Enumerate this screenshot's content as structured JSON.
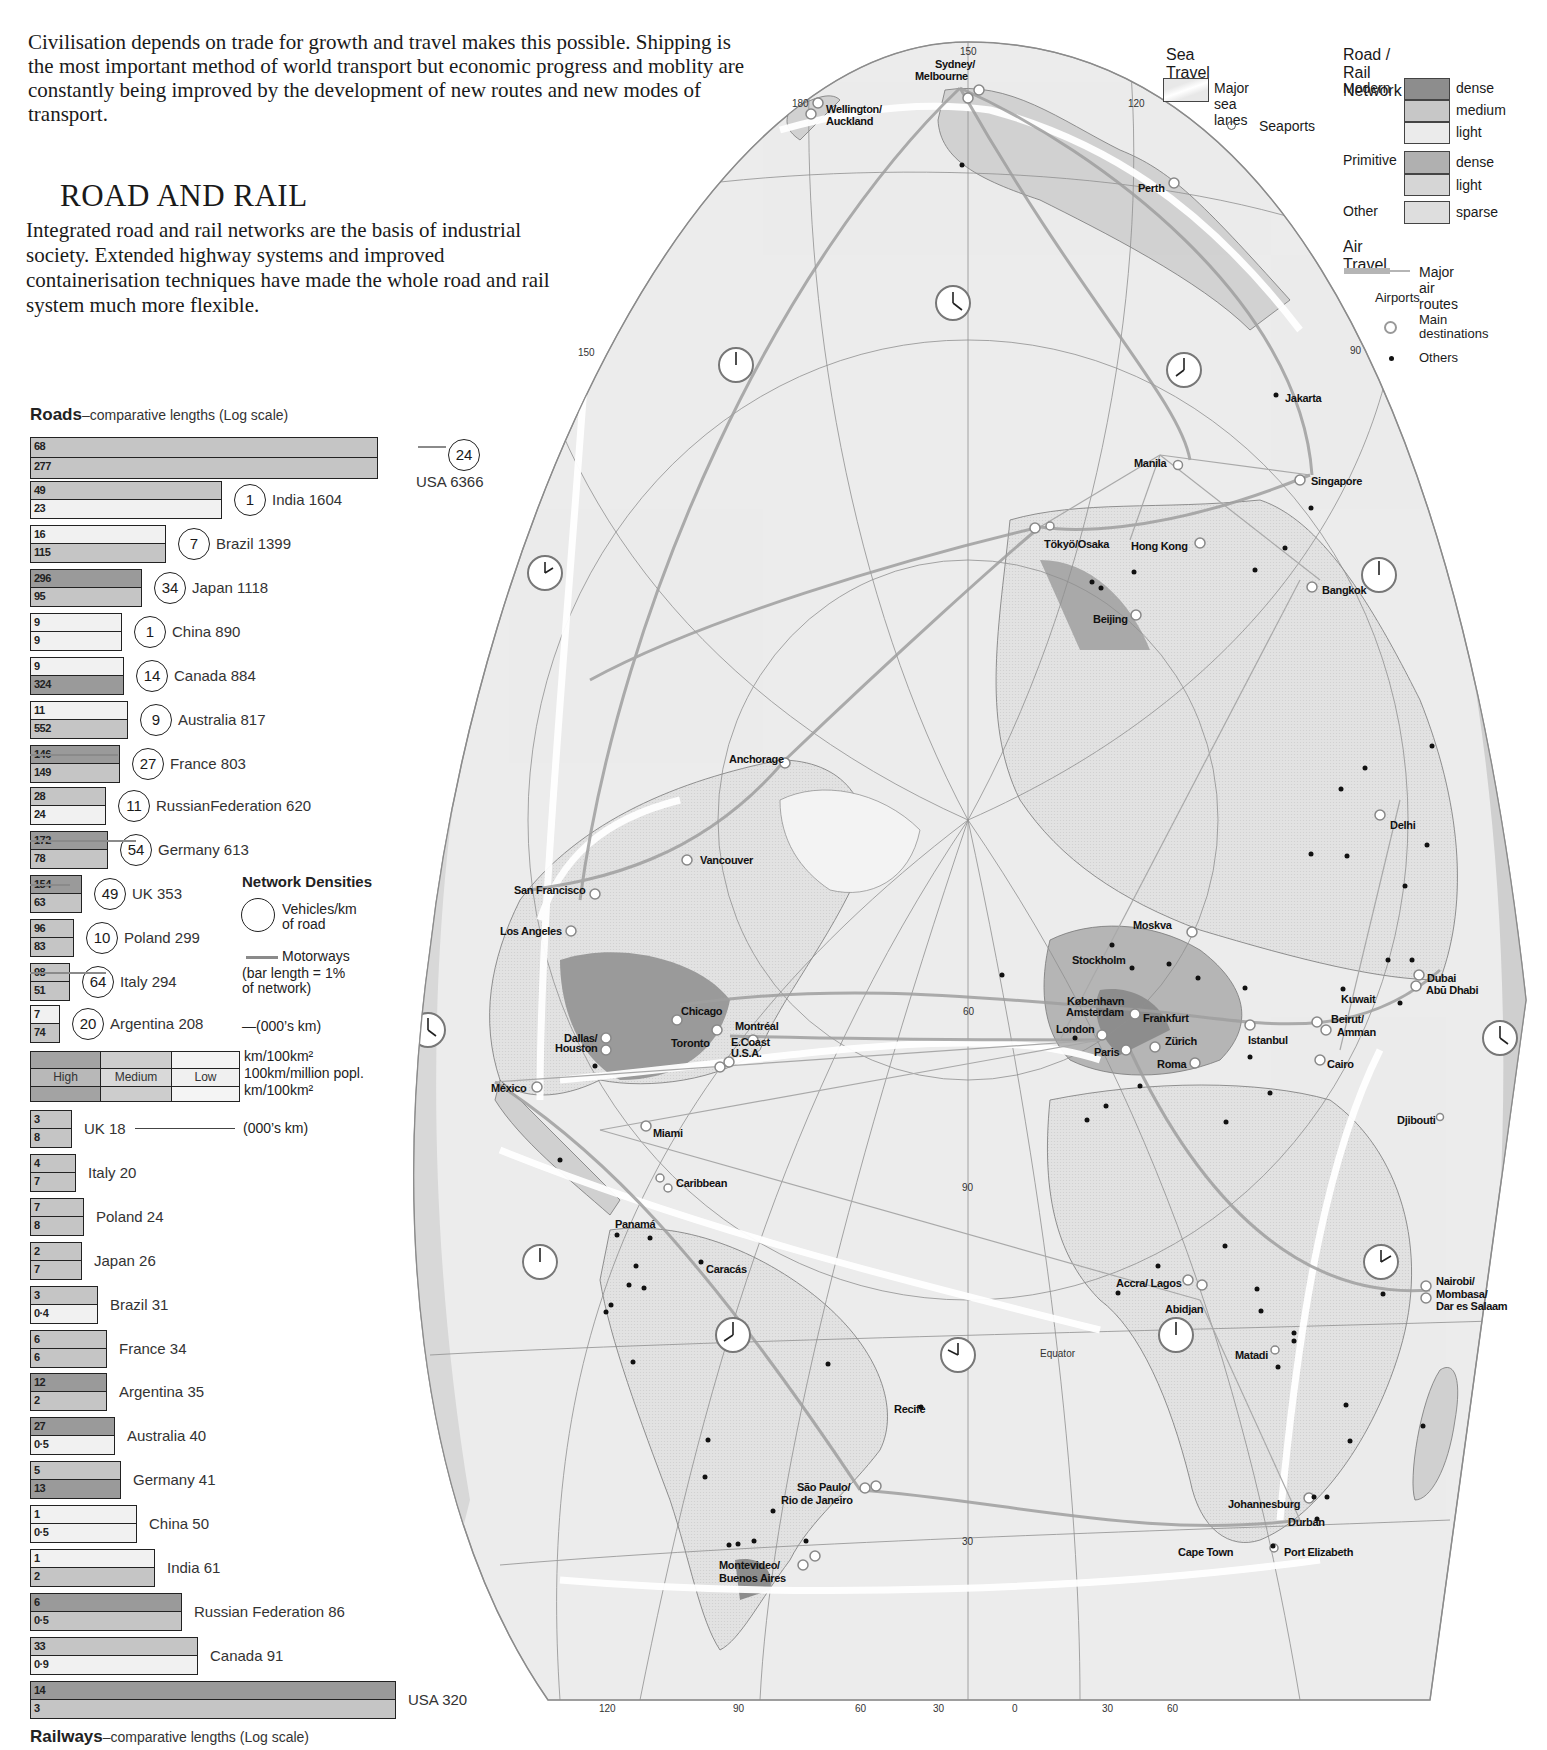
{
  "intro": {
    "text": "Civilisation depends on trade for growth and travel makes this possible. Shipping is the most important method of world transport but economic progress and moblity are constantly being improved by the development of new routes and new modes of transport."
  },
  "section": {
    "title": "ROAD AND RAIL",
    "body": "Integrated road and rail networks are the basis of industrial society. Extended highway systems and improved containerisation techniques have made the whole road and rail system much more flexible."
  },
  "roads_chart": {
    "title_bold": "Roads",
    "title_sub": "–comparative lengths  (Log scale)"
  },
  "rail_chart": {
    "title_bold": "Railways",
    "title_sub": "–comparative lengths (Log scale)"
  },
  "network_legend": {
    "title": "Network Densities",
    "circle_label_1": "Vehicles/km",
    "circle_label_2": "of road",
    "motorways_label": "Motorways",
    "motorways_note_1": "(bar length = 1%",
    "motorways_note_2": "of network)",
    "units_roads": "—(000’s km)",
    "units_rail": "(000’s km)",
    "density_high": "High",
    "density_medium": "Medium",
    "density_low": "Low",
    "unit_top": "km/100km²",
    "unit_mid": "100km/million popl.",
    "unit_bot": "km/100km²"
  },
  "chart_data": [
    {
      "type": "bar",
      "title": "Roads – comparative lengths (Log scale)",
      "xlabel": "Road length (000's km)",
      "ylabel": "",
      "categories": [
        "USA",
        "India",
        "Brazil",
        "Japan",
        "China",
        "Canada",
        "Australia",
        "France",
        "Russian Federation",
        "Germany",
        "UK",
        "Poland",
        "Italy",
        "Argentina"
      ],
      "series": [
        {
          "name": "Total length (000's km)",
          "values": [
            6366,
            1604,
            1399,
            1118,
            890,
            884,
            817,
            803,
            620,
            613,
            353,
            299,
            294,
            208
          ]
        },
        {
          "name": "Density km/100km²",
          "values": [
            68,
            49,
            16,
            296,
            9,
            9,
            11,
            146,
            28,
            172,
            154,
            96,
            98,
            7
          ]
        },
        {
          "name": "Density 100km/million popl.",
          "values": [
            277,
            23,
            115,
            95,
            9,
            324,
            552,
            149,
            24,
            78,
            63,
            83,
            51,
            74
          ]
        },
        {
          "name": "Vehicles/km of road",
          "values": [
            24,
            1,
            7,
            34,
            1,
            14,
            9,
            27,
            11,
            54,
            49,
            10,
            64,
            20
          ]
        }
      ],
      "scale": "log"
    },
    {
      "type": "bar",
      "title": "Railways – comparative lengths (Log scale)",
      "xlabel": "Rail length (000's km)",
      "ylabel": "",
      "categories": [
        "UK",
        "Italy",
        "Poland",
        "Japan",
        "Brazil",
        "France",
        "Argentina",
        "Australia",
        "Germany",
        "China",
        "India",
        "Russian Federation",
        "Canada",
        "USA"
      ],
      "series": [
        {
          "name": "Total length (000's km)",
          "values": [
            18,
            20,
            24,
            26,
            31,
            34,
            35,
            40,
            41,
            50,
            61,
            86,
            91,
            320
          ]
        },
        {
          "name": "Density km/100km²",
          "values": [
            3,
            4,
            7,
            2,
            3,
            6,
            12,
            27,
            5,
            1,
            1,
            6,
            33,
            14
          ]
        },
        {
          "name": "Density 100km/million popl.",
          "values": [
            8,
            7,
            8,
            7,
            0.4,
            6,
            2,
            0.5,
            13,
            0.5,
            2,
            0.5,
            0.9,
            3
          ]
        }
      ],
      "scale": "log"
    }
  ],
  "roads": [
    {
      "name": "USA",
      "total": "USA 6366",
      "top": "68",
      "bot": "277",
      "veh": "24",
      "w": 348,
      "ct": "med",
      "cb": "med",
      "motor": true
    },
    {
      "name": "India",
      "total": "India 1604",
      "top": "49",
      "bot": "23",
      "veh": "1",
      "w": 192,
      "ct": "med",
      "cb": "low"
    },
    {
      "name": "Brazil",
      "total": "Brazil 1399",
      "top": "16",
      "bot": "115",
      "veh": "7",
      "w": 136,
      "ct": "low",
      "cb": "med"
    },
    {
      "name": "Japan",
      "total": "Japan 1118",
      "top": "296",
      "bot": "95",
      "veh": "34",
      "w": 112,
      "ct": "high",
      "cb": "med"
    },
    {
      "name": "China",
      "total": "China 890",
      "top": "9",
      "bot": "9",
      "veh": "1",
      "w": 92,
      "ct": "low",
      "cb": "low"
    },
    {
      "name": "Canada",
      "total": "Canada 884",
      "top": "9",
      "bot": "324",
      "veh": "14",
      "w": 94,
      "ct": "low",
      "cb": "high"
    },
    {
      "name": "Australia",
      "total": "Australia 817",
      "top": "11",
      "bot": "552",
      "veh": "9",
      "w": 98,
      "ct": "low",
      "cb": "med"
    },
    {
      "name": "France",
      "total": "France 803",
      "top": "146",
      "bot": "149",
      "veh": "27",
      "w": 90,
      "ct": "high",
      "cb": "med"
    },
    {
      "name": "Russian Federation",
      "total": "RussianFederation 620",
      "top": "28",
      "bot": "24",
      "veh": "11",
      "w": 76,
      "ct": "med",
      "cb": "low"
    },
    {
      "name": "Germany",
      "total": "Germany 613",
      "top": "172",
      "bot": "78",
      "veh": "54",
      "w": 78,
      "ct": "high",
      "cb": "med"
    },
    {
      "name": "UK",
      "total": "UK 353",
      "top": "154",
      "bot": "63",
      "veh": "49",
      "w": 52,
      "ct": "high",
      "cb": "med"
    },
    {
      "name": "Poland",
      "total": "Poland 299",
      "top": "96",
      "bot": "83",
      "veh": "10",
      "w": 44,
      "ct": "med",
      "cb": "med"
    },
    {
      "name": "Italy",
      "total": "Italy 294",
      "top": "98",
      "bot": "51",
      "veh": "64",
      "w": 40,
      "ct": "med",
      "cb": "med"
    },
    {
      "name": "Argentina",
      "total": "Argentina 208",
      "top": "7",
      "bot": "74",
      "veh": "20",
      "w": 30,
      "ct": "low",
      "cb": "med"
    }
  ],
  "rail": [
    {
      "name": "UK",
      "total": "UK 18",
      "top": "3",
      "bot": "8",
      "w": 42,
      "ct": "med",
      "cb": "med"
    },
    {
      "name": "Italy",
      "total": "Italy 20",
      "top": "4",
      "bot": "7",
      "w": 46,
      "ct": "med",
      "cb": "med"
    },
    {
      "name": "Poland",
      "total": "Poland 24",
      "top": "7",
      "bot": "8",
      "w": 54,
      "ct": "med",
      "cb": "med"
    },
    {
      "name": "Japan",
      "total": "Japan 26",
      "top": "2",
      "bot": "7",
      "w": 52,
      "ct": "med",
      "cb": "med"
    },
    {
      "name": "Brazil",
      "total": "Brazil 31",
      "top": "3",
      "bot": "0·4",
      "w": 68,
      "ct": "med",
      "cb": "low"
    },
    {
      "name": "France",
      "total": "France 34",
      "top": "6",
      "bot": "6",
      "w": 77,
      "ct": "med",
      "cb": "med"
    },
    {
      "name": "Argentina",
      "total": "Argentina 35",
      "top": "12",
      "bot": "2",
      "w": 77,
      "ct": "high",
      "cb": "med"
    },
    {
      "name": "Australia",
      "total": "Australia 40",
      "top": "27",
      "bot": "0·5",
      "w": 85,
      "ct": "high",
      "cb": "low"
    },
    {
      "name": "Germany",
      "total": "Germany 41",
      "top": "5",
      "bot": "13",
      "w": 91,
      "ct": "med",
      "cb": "high"
    },
    {
      "name": "China",
      "total": "China 50",
      "top": "1",
      "bot": "0·5",
      "w": 107,
      "ct": "low",
      "cb": "low"
    },
    {
      "name": "India",
      "total": "India 61",
      "top": "1",
      "bot": "2",
      "w": 125,
      "ct": "low",
      "cb": "med"
    },
    {
      "name": "Russian Federation",
      "total": "Russian Federation 86",
      "top": "6",
      "bot": "0·5",
      "w": 152,
      "ct": "high",
      "cb": "med"
    },
    {
      "name": "Canada",
      "total": "Canada 91",
      "top": "33",
      "bot": "0·9",
      "w": 168,
      "ct": "med",
      "cb": "low"
    },
    {
      "name": "USA",
      "total": "USA 320",
      "top": "14",
      "bot": "3",
      "w": 366,
      "ct": "high",
      "cb": "med"
    }
  ],
  "map_legend": {
    "sea_title": "Sea Travel",
    "sea_lanes": "Major sea lanes",
    "seaports": "Seaports",
    "road_title": "Road / Rail Network",
    "modern": "Modern",
    "primitive": "Primitive",
    "other": "Other",
    "dense": "dense",
    "medium": "medium",
    "light": "light",
    "dense2": "dense",
    "light2": "light",
    "sparse": "sparse",
    "air_title": "Air Travel",
    "air_routes": "Major air routes",
    "airports": "Airports",
    "main_dest_1": "Main",
    "main_dest_2": "destinations",
    "others": "Others"
  },
  "map": {
    "cities": [
      {
        "name": "Sydney/",
        "x": 935,
        "y": 58
      },
      {
        "name": "Melbourne",
        "x": 915,
        "y": 70
      },
      {
        "name": "Wellington/",
        "x": 826,
        "y": 103
      },
      {
        "name": "Auckland",
        "x": 826,
        "y": 115
      },
      {
        "name": "Perth",
        "x": 1138,
        "y": 182
      },
      {
        "name": "Jakarta",
        "x": 1285,
        "y": 392
      },
      {
        "name": "Manila",
        "x": 1134,
        "y": 457
      },
      {
        "name": "Singapore",
        "x": 1311,
        "y": 475
      },
      {
        "name": "Tökyö/Osaka",
        "x": 1044,
        "y": 538
      },
      {
        "name": "Hong Kong",
        "x": 1131,
        "y": 540
      },
      {
        "name": "Bangkok",
        "x": 1322,
        "y": 584
      },
      {
        "name": "Beijing",
        "x": 1093,
        "y": 613
      },
      {
        "name": "Anchorage",
        "x": 729,
        "y": 753
      },
      {
        "name": "Delhi",
        "x": 1390,
        "y": 819
      },
      {
        "name": "Vancouver",
        "x": 700,
        "y": 854
      },
      {
        "name": "San Francisco",
        "x": 514,
        "y": 884
      },
      {
        "name": "Los Angeles",
        "x": 500,
        "y": 925
      },
      {
        "name": "Moskva",
        "x": 1133,
        "y": 919
      },
      {
        "name": "Stockholm",
        "x": 1072,
        "y": 954
      },
      {
        "name": "Dubai",
        "x": 1427,
        "y": 972
      },
      {
        "name": "Abū Dhabi",
        "x": 1426,
        "y": 984
      },
      {
        "name": "Kuwait",
        "x": 1341,
        "y": 993
      },
      {
        "name": "København",
        "x": 1067,
        "y": 995
      },
      {
        "name": "Amsterdam",
        "x": 1066,
        "y": 1006
      },
      {
        "name": "Frankfurt",
        "x": 1143,
        "y": 1012
      },
      {
        "name": "Beirut/",
        "x": 1331,
        "y": 1013
      },
      {
        "name": "Amman",
        "x": 1337,
        "y": 1026
      },
      {
        "name": "London",
        "x": 1056,
        "y": 1023
      },
      {
        "name": "Chicago",
        "x": 681,
        "y": 1005
      },
      {
        "name": "Montréal",
        "x": 735,
        "y": 1020
      },
      {
        "name": "Zürich",
        "x": 1165,
        "y": 1035
      },
      {
        "name": "Istanbul",
        "x": 1248,
        "y": 1034
      },
      {
        "name": "Dallas/",
        "x": 564,
        "y": 1032
      },
      {
        "name": "Houston",
        "x": 555,
        "y": 1042
      },
      {
        "name": "Toronto",
        "x": 671,
        "y": 1037
      },
      {
        "name": "Paris",
        "x": 1094,
        "y": 1046
      },
      {
        "name": "Roma",
        "x": 1157,
        "y": 1058
      },
      {
        "name": "Cairo",
        "x": 1327,
        "y": 1058
      },
      {
        "name": "E.Coast",
        "x": 731,
        "y": 1036
      },
      {
        "name": "U.S.A.",
        "x": 731,
        "y": 1047
      },
      {
        "name": "México",
        "x": 491,
        "y": 1082
      },
      {
        "name": "Djibouti",
        "x": 1397,
        "y": 1114
      },
      {
        "name": "Miami",
        "x": 653,
        "y": 1127
      },
      {
        "name": "Caribbean",
        "x": 676,
        "y": 1177
      },
      {
        "name": "Panamá",
        "x": 615,
        "y": 1218
      },
      {
        "name": "Caracás",
        "x": 706,
        "y": 1263
      },
      {
        "name": "Accra/ Lagos",
        "x": 1116,
        "y": 1277
      },
      {
        "name": "Nairobi/",
        "x": 1436,
        "y": 1275
      },
      {
        "name": "Mombasa/",
        "x": 1436,
        "y": 1288
      },
      {
        "name": "Dar es Salaam",
        "x": 1436,
        "y": 1300
      },
      {
        "name": "Abidjan",
        "x": 1165,
        "y": 1303
      },
      {
        "name": "Matadi",
        "x": 1235,
        "y": 1349
      },
      {
        "name": "Recife",
        "x": 894,
        "y": 1403
      },
      {
        "name": "São Paulo/",
        "x": 797,
        "y": 1481
      },
      {
        "name": "Rio de Janeiro",
        "x": 781,
        "y": 1494
      },
      {
        "name": "Johannesburg",
        "x": 1228,
        "y": 1498
      },
      {
        "name": "Durban",
        "x": 1288,
        "y": 1516
      },
      {
        "name": "Cape Town",
        "x": 1178,
        "y": 1546
      },
      {
        "name": "Port Elizabeth",
        "x": 1284,
        "y": 1546
      },
      {
        "name": "Montevideo/",
        "x": 719,
        "y": 1559
      },
      {
        "name": "Buenos Aires",
        "x": 719,
        "y": 1572
      }
    ],
    "grid_labels": [
      {
        "t": "150",
        "x": 960,
        "y": 46
      },
      {
        "t": "120",
        "x": 1128,
        "y": 98
      },
      {
        "t": "180",
        "x": 792,
        "y": 98
      },
      {
        "t": "150",
        "x": 578,
        "y": 347
      },
      {
        "t": "90",
        "x": 1350,
        "y": 345
      },
      {
        "t": "60",
        "x": 963,
        "y": 1006
      },
      {
        "t": "90",
        "x": 962,
        "y": 1182
      },
      {
        "t": "30",
        "x": 962,
        "y": 1536
      },
      {
        "t": "120",
        "x": 599,
        "y": 1703
      },
      {
        "t": "90",
        "x": 733,
        "y": 1703
      },
      {
        "t": "60",
        "x": 855,
        "y": 1703
      },
      {
        "t": "30",
        "x": 933,
        "y": 1703
      },
      {
        "t": "0",
        "x": 1012,
        "y": 1703
      },
      {
        "t": "30",
        "x": 1102,
        "y": 1703
      },
      {
        "t": "60",
        "x": 1167,
        "y": 1703
      }
    ],
    "equator_label": "Equator"
  }
}
